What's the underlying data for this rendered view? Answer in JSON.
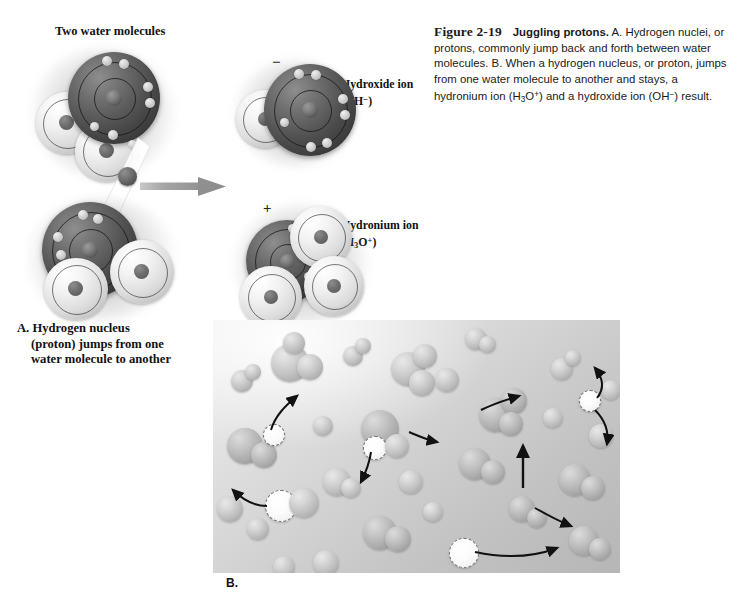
{
  "figure": {
    "number": "Figure 2-19",
    "lead": "Juggling protons.",
    "body": " A. Hydrogen nuclei, or protons, commonly jump back and forth between water molecules. B. When a hydrogen nucleus, or proton, jumps from one water molecule to another and stays, a hydronium ion (H3O+) and a hydroxide ion (OH−) result."
  },
  "labels": {
    "two_water_molecules": "Two water molecules",
    "panel_a_line1": "A. Hydrogen nucleus",
    "panel_a_line2": "(proton) jumps from one",
    "panel_a_line3": "water molecule to another",
    "panel_b": "B.",
    "hydroxide_name": "Hydroxide ion",
    "hydroxide_formula": "(OH−)",
    "hydronium_name": "Hydronium ion",
    "hydronium_formula": "(H3O+)",
    "charge_minus": "−",
    "charge_plus": "+"
  },
  "colors": {
    "oxygen": "#4f4f4f",
    "hydrogen": "#e4e4e4",
    "panel_b_background": "#c9c9c9",
    "arrow": "#9a9a9a",
    "text": "#111111"
  },
  "diagram": {
    "type": "molecular-illustration",
    "panel_a_caption_parts": [
      "A.",
      "Hydrogen nucleus",
      "(proton) jumps from one",
      "water molecule to another"
    ],
    "reactants": [
      "water molecule",
      "water molecule"
    ],
    "products": [
      "Hydroxide ion (OH−)",
      "Hydronium ion (H3O+)"
    ],
    "reaction_arrow_direction": "right"
  }
}
